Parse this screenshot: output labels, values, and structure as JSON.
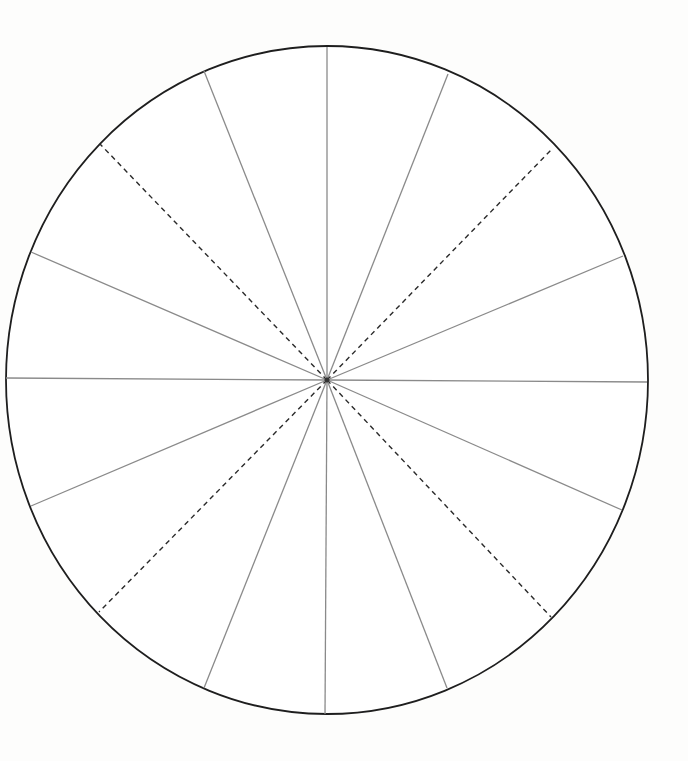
{
  "diagram": {
    "type": "segmented-circle-template",
    "segment_count": 16,
    "colors": {
      "background": "#fdfdfc",
      "fill": "#ffffff",
      "outline": "#1e1e1e",
      "solid_spoke": "#8a8a8a",
      "dashed_spoke": "#2a2a2a"
    },
    "ellipse": {
      "cx": 327,
      "cy": 380,
      "rx": 321,
      "ry": 334
    },
    "center": {
      "x": 327,
      "y": 380
    },
    "spokes": [
      {
        "id": "spoke-top",
        "x": 327,
        "y": 47,
        "style": "solid"
      },
      {
        "id": "spoke-top-right-1",
        "x": 448,
        "y": 74,
        "style": "solid"
      },
      {
        "id": "spoke-top-right-2",
        "x": 553,
        "y": 148,
        "style": "dashed"
      },
      {
        "id": "spoke-top-right-3",
        "x": 623,
        "y": 256,
        "style": "solid"
      },
      {
        "id": "spoke-right",
        "x": 647,
        "y": 382,
        "style": "solid"
      },
      {
        "id": "spoke-bot-right-1",
        "x": 622,
        "y": 510,
        "style": "solid"
      },
      {
        "id": "spoke-bot-right-2",
        "x": 551,
        "y": 617,
        "style": "dashed"
      },
      {
        "id": "spoke-bot-right-3",
        "x": 447,
        "y": 688,
        "style": "solid"
      },
      {
        "id": "spoke-bottom",
        "x": 325,
        "y": 714,
        "style": "solid"
      },
      {
        "id": "spoke-bot-left-1",
        "x": 204,
        "y": 688,
        "style": "solid"
      },
      {
        "id": "spoke-bot-left-2",
        "x": 99,
        "y": 612,
        "style": "dashed"
      },
      {
        "id": "spoke-bot-left-3",
        "x": 31,
        "y": 506,
        "style": "solid"
      },
      {
        "id": "spoke-left",
        "x": 6,
        "y": 378,
        "style": "solid"
      },
      {
        "id": "spoke-top-left-1",
        "x": 31,
        "y": 252,
        "style": "solid"
      },
      {
        "id": "spoke-top-left-2",
        "x": 100,
        "y": 144,
        "style": "dashed"
      },
      {
        "id": "spoke-top-left-3",
        "x": 204,
        "y": 71,
        "style": "solid"
      }
    ]
  }
}
